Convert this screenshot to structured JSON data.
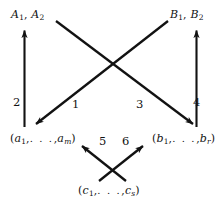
{
  "figure": {
    "type": "diagram",
    "kind": "arrow-diagram",
    "background_color": "#ffffff",
    "ink_color": "#121212"
  },
  "nodes": {
    "top_left": {
      "id": "A",
      "text": "A1, A2",
      "base1": "A",
      "sub1": "1",
      "sep": ", ",
      "base2": "A",
      "sub2": "2"
    },
    "top_right": {
      "id": "B",
      "text": "B1, B2",
      "base1": "B",
      "sub1": "1",
      "sep": ", ",
      "base2": "B",
      "sub2": "2"
    },
    "bottom_left": {
      "id": "a-tuple",
      "text": "(a1, . . . , am)",
      "open": "(",
      "first_base": "a",
      "first_sub": "1",
      "comma1": ",",
      "dots": ". . .",
      "comma2": ",",
      "last_base": "a",
      "last_sub": "m",
      "close": ")"
    },
    "bottom_right": {
      "id": "b-tuple",
      "text": "(b1, . . . , br)",
      "open": "(",
      "first_base": "b",
      "first_sub": "1",
      "comma1": ",",
      "dots": ". . .",
      "comma2": ",",
      "last_base": "b",
      "last_sub": "r",
      "close": ")"
    },
    "bottom_center": {
      "id": "c-tuple",
      "text": "(c1, . . . , cs)",
      "open": "(",
      "first_base": "c",
      "first_sub": "1",
      "comma1": ",",
      "dots": ". . .",
      "comma2": ",",
      "last_base": "c",
      "last_sub": "s",
      "close": ")"
    }
  },
  "edges": [
    {
      "label": "1",
      "from": "top_right",
      "to": "bottom_left",
      "direction": "down-left",
      "style": "solid-arrow"
    },
    {
      "label": "2",
      "from": "bottom_left",
      "to": "top_left",
      "direction": "up",
      "style": "solid-arrow"
    },
    {
      "label": "3",
      "from": "top_left",
      "to": "bottom_right",
      "direction": "down-right",
      "style": "solid-arrow"
    },
    {
      "label": "4",
      "from": "bottom_right",
      "to": "top_right",
      "direction": "up",
      "style": "solid-arrow"
    },
    {
      "label": "5",
      "from": "bottom_center",
      "to": "bottom_left",
      "direction": "up-left",
      "style": "solid-arrow"
    },
    {
      "label": "6",
      "from": "bottom_center",
      "to": "bottom_right",
      "direction": "up-right",
      "style": "solid-arrow"
    }
  ],
  "edge_labels": {
    "one": "1",
    "two": "2",
    "three": "3",
    "four": "4",
    "five": "5",
    "six": "6"
  }
}
